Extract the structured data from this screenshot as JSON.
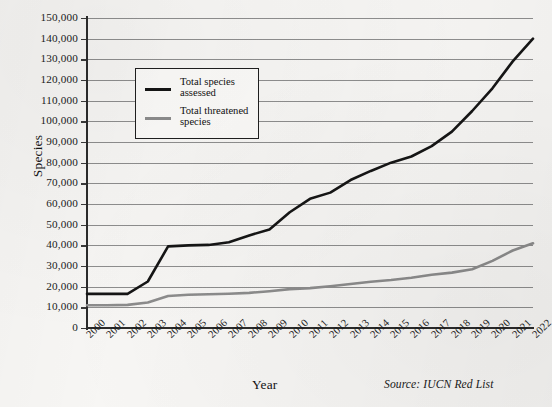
{
  "chart_data": {
    "type": "line",
    "title": "",
    "xlabel": "Year",
    "ylabel": "Species",
    "source_note": "Source: IUCN Red List",
    "grid": true,
    "legend_position": "upper-left-inside",
    "xlim": [
      2000,
      2022
    ],
    "ylim": [
      0,
      150000
    ],
    "ytick_interval": 10000,
    "categories": [
      "2000",
      "2001",
      "2002",
      "2003",
      "2004",
      "2005",
      "2006",
      "2007",
      "2008",
      "2009",
      "2010",
      "2011",
      "2012",
      "2013",
      "2014",
      "2015",
      "2016",
      "2017",
      "2018",
      "2019",
      "2020",
      "2021",
      "2022"
    ],
    "ytick_labels": [
      "150,000",
      "140,000",
      "130,000",
      "120,000",
      "110,000",
      "100,000",
      "90,000",
      "80,000",
      "70,000",
      "60,000",
      "50,000",
      "40,000",
      "30,000",
      "20,000",
      "10,000",
      "0"
    ],
    "ytick_values": [
      150000,
      140000,
      130000,
      120000,
      110000,
      100000,
      90000,
      80000,
      70000,
      60000,
      50000,
      40000,
      30000,
      20000,
      10000,
      0
    ],
    "series": [
      {
        "name": "Total species assessed",
        "color": "#151515",
        "values": [
          16500,
          16500,
          16500,
          22500,
          39500,
          40000,
          40200,
          41500,
          44800,
          47700,
          56000,
          62500,
          65500,
          71600,
          76000,
          80000,
          83000,
          88000,
          95000,
          105000,
          116000,
          129000,
          140000
        ]
      },
      {
        "name": "Total threatened species",
        "color": "#8c8c8c",
        "values": [
          11000,
          11000,
          11200,
          12300,
          15500,
          16100,
          16300,
          16600,
          17000,
          17800,
          18800,
          19300,
          20200,
          21300,
          22400,
          23200,
          24300,
          25800,
          26800,
          28400,
          32500,
          37500,
          41000
        ]
      }
    ]
  },
  "legend": {
    "entries": [
      {
        "label": "Total species assessed",
        "color": "#151515"
      },
      {
        "label": "Total threatened species",
        "color": "#8c8c8c"
      }
    ]
  },
  "axes": {
    "y_title": "Species",
    "x_title": "Year"
  },
  "footer": {
    "source": "Source: IUCN Red List"
  }
}
